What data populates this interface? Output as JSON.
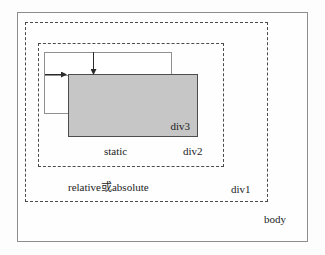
{
  "diagram": {
    "boxes": {
      "body": {
        "label": "body",
        "style": "solid",
        "border_color": "#8d8d8d",
        "fill": "#fefefe"
      },
      "div1": {
        "label": "div1",
        "style": "dashed",
        "border_color": "#4b4b4b",
        "fill": "none"
      },
      "div2": {
        "label": "div2",
        "style": "dashed",
        "border_color": "#4b4b4b",
        "fill": "none"
      },
      "div3": {
        "label": "div3",
        "style": "solid",
        "border_color": "#4d4d4d",
        "fill": "#c6c6c6"
      }
    },
    "annotations": {
      "static_label": "static",
      "relative_absolute_label": "relative或absolute"
    },
    "flow_boxes": [
      {
        "name": "top-flow-outline"
      },
      {
        "name": "left-flow-outline"
      }
    ],
    "arrows": [
      {
        "name": "vertical-offset-arrow",
        "direction": "down"
      },
      {
        "name": "horizontal-offset-arrow",
        "direction": "right"
      }
    ]
  }
}
